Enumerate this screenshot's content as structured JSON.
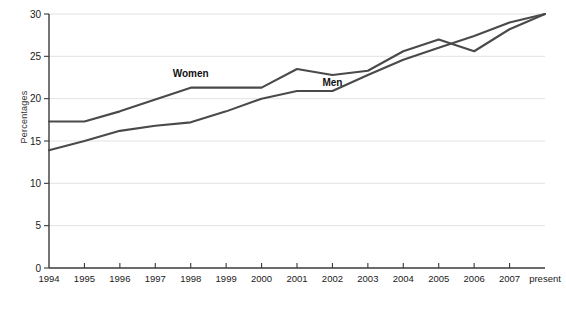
{
  "chart_data": {
    "type": "line",
    "title": "",
    "xlabel": "",
    "ylabel": "Percentages",
    "ylim": [
      0,
      30
    ],
    "yticks": [
      0,
      5,
      10,
      15,
      20,
      25,
      30
    ],
    "grid": true,
    "legend_position": "inline-labels",
    "categories": [
      "1994",
      "1995",
      "1996",
      "1997",
      "1998",
      "1999",
      "2000",
      "2001",
      "2002",
      "2003",
      "2004",
      "2005",
      "2006",
      "2007",
      "present"
    ],
    "series": [
      {
        "name": "Women",
        "color": "#4a4a4a",
        "values": [
          17.3,
          17.3,
          18.5,
          19.9,
          21.3,
          21.3,
          21.3,
          23.5,
          22.8,
          23.3,
          25.6,
          27.0,
          25.6,
          28.2,
          30.0
        ]
      },
      {
        "name": "Men",
        "color": "#4a4a4a",
        "values": [
          13.9,
          15.0,
          16.2,
          16.8,
          17.2,
          18.5,
          20.0,
          20.9,
          20.9,
          22.8,
          24.6,
          26.0,
          27.4,
          29.0,
          30.0
        ]
      }
    ],
    "annotations": [
      {
        "text": "Women",
        "x_category": "1998",
        "value": 22.6
      },
      {
        "text": "Men",
        "x_category": "2002",
        "value": 21.5
      }
    ]
  },
  "caption": {
    "text": ""
  }
}
